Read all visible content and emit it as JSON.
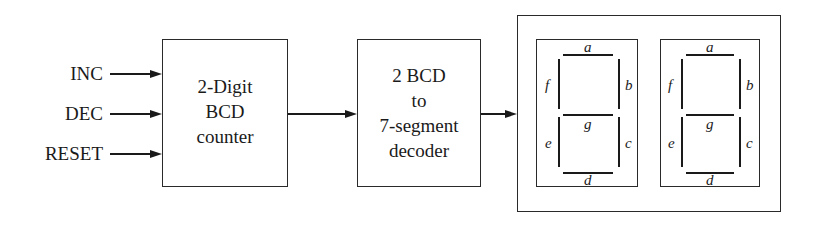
{
  "diagram": {
    "inputs": [
      {
        "label": "INC"
      },
      {
        "label": "DEC"
      },
      {
        "label": "RESET"
      }
    ],
    "counter": {
      "lines": [
        "2-Digit",
        "BCD",
        "counter"
      ]
    },
    "decoder": {
      "lines": [
        "2 BCD",
        "to",
        "7-segment",
        "decoder"
      ]
    },
    "display": {
      "digits": [
        {
          "segments": {
            "a": "a",
            "b": "b",
            "c": "c",
            "d": "d",
            "e": "e",
            "f": "f",
            "g": "g"
          }
        },
        {
          "segments": {
            "a": "a",
            "b": "b",
            "c": "c",
            "d": "d",
            "e": "e",
            "f": "f",
            "g": "g"
          }
        }
      ]
    },
    "colors": {
      "line": "#1a1a1a",
      "background": "#ffffff"
    }
  }
}
